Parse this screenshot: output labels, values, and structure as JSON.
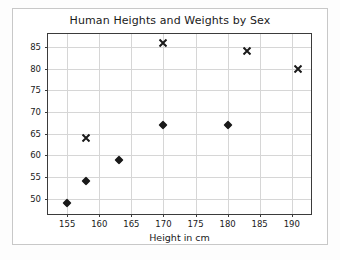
{
  "chart_data": {
    "type": "scatter",
    "title": "Human Heights and Weights by Sex",
    "xlabel": "Height in cm",
    "ylabel": "Weight in kg",
    "xlim": [
      152,
      193
    ],
    "ylim": [
      46.5,
      88
    ],
    "xticks": [
      155,
      160,
      165,
      170,
      175,
      180,
      185,
      190
    ],
    "yticks": [
      50,
      55,
      60,
      65,
      70,
      75,
      80,
      85
    ],
    "grid": true,
    "legend": "none",
    "series": [
      {
        "name": "female",
        "marker": "diamond-filled",
        "color": "#1a1a1a",
        "points": [
          {
            "x": 155,
            "y": 49
          },
          {
            "x": 158,
            "y": 54
          },
          {
            "x": 163,
            "y": 59
          },
          {
            "x": 170,
            "y": 67
          },
          {
            "x": 180,
            "y": 67
          }
        ]
      },
      {
        "name": "male",
        "marker": "x",
        "color": "#1a1a1a",
        "points": [
          {
            "x": 158,
            "y": 64
          },
          {
            "x": 170,
            "y": 86
          },
          {
            "x": 183,
            "y": 84
          },
          {
            "x": 191,
            "y": 80
          }
        ]
      }
    ]
  }
}
